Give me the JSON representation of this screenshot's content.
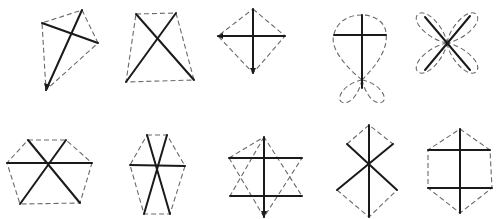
{
  "figure": {
    "width": 500,
    "height": 219,
    "colors": {
      "solid": "#1a1a1a",
      "dashed": "#6a6a6a",
      "background": "#ffffff"
    },
    "rows": [
      {
        "row": "top",
        "figures": [
          {
            "id": "fig-1",
            "shape": "kite",
            "solid_lines": 2,
            "outline": "dashed quadrilateral",
            "arrow": "bottom"
          },
          {
            "id": "fig-2",
            "shape": "trapezoid-with-diagonals",
            "solid_lines": 2,
            "outline": "dashed trapezoid"
          },
          {
            "id": "fig-3",
            "shape": "rhombus-cross",
            "solid_lines": 2,
            "outline": "dashed rhombus",
            "arrows": "left, bottom"
          },
          {
            "id": "fig-4",
            "shape": "cross-with-loops",
            "solid_lines": 2,
            "outline": "dashed teardrop with two lower loops"
          },
          {
            "id": "fig-5",
            "shape": "four-petal-x",
            "solid_lines": 2,
            "outline": "dashed four petals"
          }
        ]
      },
      {
        "row": "bottom",
        "figures": [
          {
            "id": "fig-6",
            "shape": "hexagon-three-diagonals",
            "solid_lines": 3,
            "outline": "dashed hexagon"
          },
          {
            "id": "fig-7",
            "shape": "elongated-hexagon-three-diagonals",
            "solid_lines": 3,
            "outline": "dashed hexagon"
          },
          {
            "id": "fig-8",
            "shape": "star-of-david",
            "solid_lines": 3,
            "outline": "dashed hexagram edges",
            "arrow": "bottom"
          },
          {
            "id": "fig-9",
            "shape": "double-rhombus",
            "solid_lines": 3,
            "outline": "dashed bowtie-diamond"
          },
          {
            "id": "fig-10",
            "shape": "hexagon-h-cross",
            "solid_lines": 3,
            "outline": "dashed hexagon"
          }
        ]
      }
    ]
  }
}
